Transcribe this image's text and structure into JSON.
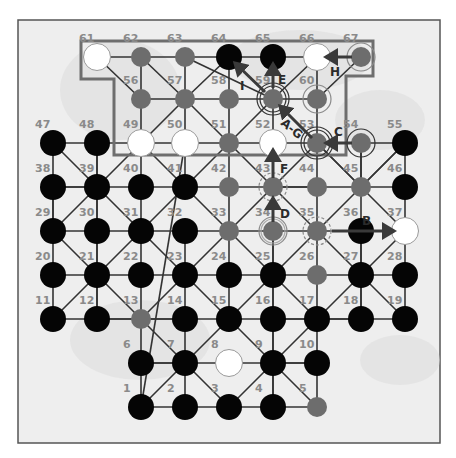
{
  "board": {
    "frame": {
      "x": 18,
      "y": 20,
      "w": 422,
      "h": 423
    },
    "colors": {
      "black": "#050505",
      "white": "#ffffff",
      "gray": "#6d6d6d",
      "line": "#333333",
      "label": "#8a8a8a",
      "region": "#6e6e6e",
      "arrow": "#3a3a3a",
      "ring": "#333333"
    },
    "highlight_region": [
      [
        81,
        41
      ],
      [
        373,
        41
      ],
      [
        373,
        76
      ],
      [
        346,
        76
      ],
      [
        346,
        155
      ],
      [
        114,
        155
      ],
      [
        114,
        79
      ],
      [
        81,
        79
      ]
    ],
    "points": [
      {
        "id": "1",
        "x": 141,
        "y": 407,
        "piece": "black"
      },
      {
        "id": "2",
        "x": 185,
        "y": 407,
        "piece": "black"
      },
      {
        "id": "3",
        "x": 229,
        "y": 407,
        "piece": "black"
      },
      {
        "id": "4",
        "x": 273,
        "y": 407,
        "piece": "black"
      },
      {
        "id": "5",
        "x": 317,
        "y": 407,
        "piece": "gray"
      },
      {
        "id": "6",
        "x": 141,
        "y": 363,
        "piece": "black"
      },
      {
        "id": "7",
        "x": 185,
        "y": 363,
        "piece": "black"
      },
      {
        "id": "8",
        "x": 229,
        "y": 363,
        "piece": "white"
      },
      {
        "id": "9",
        "x": 273,
        "y": 363,
        "piece": "black"
      },
      {
        "id": "10",
        "x": 317,
        "y": 363,
        "piece": "black"
      },
      {
        "id": "11",
        "x": 53,
        "y": 319,
        "piece": "black"
      },
      {
        "id": "12",
        "x": 97,
        "y": 319,
        "piece": "black"
      },
      {
        "id": "13",
        "x": 141,
        "y": 319,
        "piece": "gray"
      },
      {
        "id": "14",
        "x": 185,
        "y": 319,
        "piece": "black"
      },
      {
        "id": "15",
        "x": 229,
        "y": 319,
        "piece": "black"
      },
      {
        "id": "16",
        "x": 273,
        "y": 319,
        "piece": "black"
      },
      {
        "id": "17",
        "x": 317,
        "y": 319,
        "piece": "black"
      },
      {
        "id": "18",
        "x": 361,
        "y": 319,
        "piece": "black"
      },
      {
        "id": "19",
        "x": 405,
        "y": 319,
        "piece": "black"
      },
      {
        "id": "20",
        "x": 53,
        "y": 275,
        "piece": "black"
      },
      {
        "id": "21",
        "x": 97,
        "y": 275,
        "piece": "black"
      },
      {
        "id": "22",
        "x": 141,
        "y": 275,
        "piece": "black"
      },
      {
        "id": "23",
        "x": 185,
        "y": 275,
        "piece": "black"
      },
      {
        "id": "24",
        "x": 229,
        "y": 275,
        "piece": "black"
      },
      {
        "id": "25",
        "x": 273,
        "y": 275,
        "piece": "black"
      },
      {
        "id": "26",
        "x": 317,
        "y": 275,
        "piece": "gray"
      },
      {
        "id": "27",
        "x": 361,
        "y": 275,
        "piece": "black"
      },
      {
        "id": "28",
        "x": 405,
        "y": 275,
        "piece": "black"
      },
      {
        "id": "29",
        "x": 53,
        "y": 231,
        "piece": "black"
      },
      {
        "id": "30",
        "x": 97,
        "y": 231,
        "piece": "black"
      },
      {
        "id": "31",
        "x": 141,
        "y": 231,
        "piece": "black"
      },
      {
        "id": "32",
        "x": 185,
        "y": 231,
        "piece": "black"
      },
      {
        "id": "33",
        "x": 229,
        "y": 231,
        "piece": "gray"
      },
      {
        "id": "34",
        "x": 273,
        "y": 231,
        "piece": "gray",
        "ring": "double-gray"
      },
      {
        "id": "35",
        "x": 317,
        "y": 231,
        "piece": "gray",
        "ring": "dashed"
      },
      {
        "id": "36",
        "x": 361,
        "y": 231,
        "piece": "black"
      },
      {
        "id": "37",
        "x": 405,
        "y": 231,
        "piece": "white"
      },
      {
        "id": "38",
        "x": 53,
        "y": 187,
        "piece": "black"
      },
      {
        "id": "39",
        "x": 97,
        "y": 187,
        "piece": "black"
      },
      {
        "id": "40",
        "x": 141,
        "y": 187,
        "piece": "black"
      },
      {
        "id": "41",
        "x": 185,
        "y": 187,
        "piece": "black"
      },
      {
        "id": "42",
        "x": 229,
        "y": 187,
        "piece": "gray"
      },
      {
        "id": "43",
        "x": 273,
        "y": 187,
        "piece": "gray",
        "ring": "dashed"
      },
      {
        "id": "44",
        "x": 317,
        "y": 187,
        "piece": "gray"
      },
      {
        "id": "45",
        "x": 361,
        "y": 187,
        "piece": "gray"
      },
      {
        "id": "46",
        "x": 405,
        "y": 187,
        "piece": "black"
      },
      {
        "id": "47",
        "x": 53,
        "y": 143,
        "piece": "black"
      },
      {
        "id": "48",
        "x": 97,
        "y": 143,
        "piece": "black"
      },
      {
        "id": "49",
        "x": 141,
        "y": 143,
        "piece": "white"
      },
      {
        "id": "50",
        "x": 185,
        "y": 143,
        "piece": "white"
      },
      {
        "id": "51",
        "x": 229,
        "y": 143,
        "piece": "gray"
      },
      {
        "id": "52",
        "x": 273,
        "y": 143,
        "piece": "white"
      },
      {
        "id": "53",
        "x": 317,
        "y": 143,
        "piece": "gray",
        "ring": "double-black"
      },
      {
        "id": "54",
        "x": 361,
        "y": 143,
        "piece": "gray",
        "ring": "single-black"
      },
      {
        "id": "55",
        "x": 405,
        "y": 143,
        "piece": "black"
      },
      {
        "id": "56",
        "x": 141,
        "y": 99,
        "piece": "gray"
      },
      {
        "id": "57",
        "x": 185,
        "y": 99,
        "piece": "gray"
      },
      {
        "id": "58",
        "x": 229,
        "y": 99,
        "piece": "gray"
      },
      {
        "id": "59",
        "x": 273,
        "y": 99,
        "piece": "gray",
        "ring": "double-black"
      },
      {
        "id": "60",
        "x": 317,
        "y": 99,
        "piece": "gray",
        "ring": "single-gray"
      },
      {
        "id": "61",
        "x": 97,
        "y": 57,
        "piece": "white"
      },
      {
        "id": "62",
        "x": 141,
        "y": 57,
        "piece": "gray"
      },
      {
        "id": "63",
        "x": 185,
        "y": 57,
        "piece": "gray"
      },
      {
        "id": "64",
        "x": 229,
        "y": 57,
        "piece": "black"
      },
      {
        "id": "65",
        "x": 273,
        "y": 57,
        "piece": "black"
      },
      {
        "id": "66",
        "x": 317,
        "y": 57,
        "piece": "white"
      },
      {
        "id": "67",
        "x": 361,
        "y": 57,
        "piece": "gray",
        "ring": "single-gray"
      }
    ],
    "lines": [
      [
        "61",
        "67"
      ],
      [
        "56",
        "60"
      ],
      [
        "47",
        "55"
      ],
      [
        "38",
        "46"
      ],
      [
        "29",
        "37"
      ],
      [
        "20",
        "28"
      ],
      [
        "11",
        "19"
      ],
      [
        "6",
        "10"
      ],
      [
        "1",
        "5"
      ],
      [
        "47",
        "11"
      ],
      [
        "48",
        "12"
      ],
      [
        "38",
        "29"
      ],
      [
        "49",
        "40"
      ],
      [
        "40",
        "13"
      ],
      [
        "50",
        "1"
      ],
      [
        "51",
        "15"
      ],
      [
        "52",
        "4"
      ],
      [
        "53",
        "17"
      ],
      [
        "54",
        "18"
      ],
      [
        "55",
        "19"
      ],
      [
        "62",
        "56"
      ],
      [
        "56",
        "49"
      ],
      [
        "63",
        "57"
      ],
      [
        "57",
        "50"
      ],
      [
        "64",
        "58"
      ],
      [
        "58",
        "51"
      ],
      [
        "65",
        "59"
      ],
      [
        "59",
        "52"
      ],
      [
        "66",
        "60"
      ],
      [
        "60",
        "53"
      ],
      [
        "13",
        "6"
      ],
      [
        "6",
        "1"
      ],
      [
        "17",
        "10"
      ],
      [
        "10",
        "5"
      ],
      [
        "47",
        "39"
      ],
      [
        "39",
        "31"
      ],
      [
        "31",
        "23"
      ],
      [
        "23",
        "15"
      ],
      [
        "15",
        "9"
      ],
      [
        "9",
        "5"
      ],
      [
        "61",
        "56"
      ],
      [
        "56",
        "?"
      ],
      [
        "62",
        "57"
      ],
      [
        "57",
        "51"
      ],
      [
        "51",
        "43"
      ],
      [
        "43",
        "35"
      ],
      [
        "35",
        "27"
      ],
      [
        "27",
        "19"
      ],
      [
        "64",
        "57"
      ],
      [
        "57",
        "49"
      ],
      [
        "49",
        "39"
      ],
      [
        "39",
        "29"
      ],
      [
        "29",
        "21"
      ],
      [
        "21",
        "13"
      ],
      [
        "13",
        "7"
      ],
      [
        "7",
        "3"
      ],
      [
        "3",
        "9"
      ],
      [
        "9",
        "17"
      ],
      [
        "17",
        "27"
      ],
      [
        "27",
        "37"
      ],
      [
        "37",
        "45"
      ],
      [
        "45",
        "53"
      ],
      [
        "53",
        "59"
      ],
      [
        "59",
        "63"
      ],
      [
        "66",
        "59"
      ],
      [
        "59",
        "51"
      ],
      [
        "51",
        "41"
      ],
      [
        "41",
        "31"
      ],
      [
        "31",
        "21"
      ],
      [
        "21",
        "11"
      ],
      [
        "67",
        "60"
      ],
      [
        "53",
        "45"
      ],
      [
        "45",
        "55"
      ],
      [
        "55",
        "45"
      ],
      [
        "45",
        "35"
      ],
      [
        "35",
        "25"
      ],
      [
        "25",
        "15"
      ],
      [
        "15",
        "7"
      ],
      [
        "7",
        "1"
      ],
      [
        "41",
        "33"
      ],
      [
        "33",
        "25"
      ],
      [
        "25",
        "17"
      ],
      [
        "39",
        "48"
      ],
      [
        "41",
        "49"
      ],
      [
        "41",
        "50"
      ],
      [
        "43",
        "52"
      ],
      [
        "43",
        "53"
      ],
      [
        "45",
        "54"
      ],
      [
        "23",
        "13"
      ],
      [
        "23",
        "33"
      ],
      [
        "33",
        "43"
      ],
      [
        "21",
        "12"
      ],
      [
        "21",
        "30"
      ],
      [
        "23",
        "14"
      ],
      [
        "23",
        "32"
      ],
      [
        "25",
        "16"
      ],
      [
        "25",
        "34"
      ],
      [
        "27",
        "18"
      ],
      [
        "27",
        "36"
      ],
      [
        "39",
        "30"
      ],
      [
        "39",
        "38"
      ],
      [
        "43",
        "34"
      ],
      [
        "43",
        "44"
      ],
      [
        "7",
        "14"
      ],
      [
        "9",
        "16"
      ],
      [
        "7",
        "2"
      ],
      [
        "9",
        "4"
      ],
      [
        "7",
        "6"
      ],
      [
        "9",
        "10"
      ],
      [
        "13",
        "12"
      ],
      [
        "13",
        "14"
      ],
      [
        "17",
        "16"
      ],
      [
        "17",
        "18"
      ]
    ],
    "arrows": [
      {
        "label": "A-G",
        "from": [
          312,
          138
        ],
        "to": [
          280,
          106
        ],
        "label_x": 280,
        "label_y": 124,
        "label_rotate": 40
      },
      {
        "label": "B",
        "from": [
          332,
          231
        ],
        "to": [
          394,
          231
        ],
        "label_x": 362,
        "label_y": 225,
        "label_rotate": 0
      },
      {
        "label": "C",
        "from": [
          352,
          143
        ],
        "to": [
          326,
          143
        ],
        "label_x": 334,
        "label_y": 136,
        "label_rotate": 0
      },
      {
        "label": "D",
        "from": [
          273,
          222
        ],
        "to": [
          273,
          198
        ],
        "label_x": 280,
        "label_y": 218,
        "label_rotate": 0
      },
      {
        "label": "E",
        "from": [
          273,
          88
        ],
        "to": [
          273,
          64
        ],
        "label_x": 278,
        "label_y": 84,
        "label_rotate": 0
      },
      {
        "label": "F",
        "from": [
          273,
          178
        ],
        "to": [
          273,
          150
        ],
        "label_x": 280,
        "label_y": 173,
        "label_rotate": 0
      },
      {
        "label": "H",
        "from": [
          352,
          57
        ],
        "to": [
          326,
          57
        ],
        "label_x": 330,
        "label_y": 76,
        "label_rotate": 0
      },
      {
        "label": "I",
        "from": [
          265,
          92
        ],
        "to": [
          235,
          63
        ],
        "label_x": 240,
        "label_y": 90,
        "label_rotate": 0
      }
    ]
  }
}
